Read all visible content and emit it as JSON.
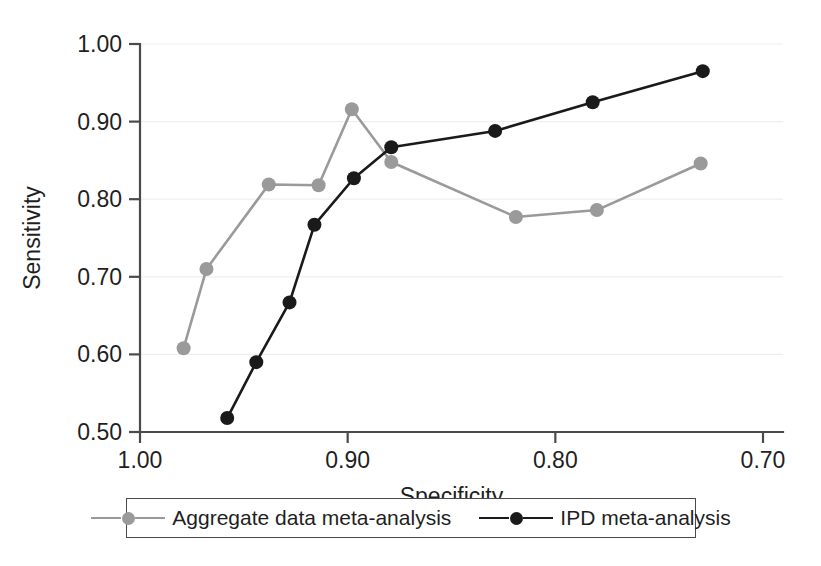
{
  "chart_data": {
    "type": "line",
    "title": "",
    "xlabel": "Specificity",
    "ylabel": "Sensitivity",
    "xlim": [
      1.0,
      0.7
    ],
    "ylim": [
      0.5,
      1.0
    ],
    "x_ticks": [
      "1.00",
      "0.90",
      "0.80",
      "0.70"
    ],
    "x_tick_values": [
      1.0,
      0.9,
      0.8,
      0.7
    ],
    "y_ticks": [
      "0.50",
      "0.60",
      "0.70",
      "0.80",
      "0.90",
      "1.00"
    ],
    "y_tick_values": [
      0.5,
      0.6,
      0.7,
      0.8,
      0.9,
      1.0
    ],
    "x_axis_reversed": true,
    "grid": "horizontal",
    "legend_position": "below",
    "series": [
      {
        "name": "Aggregate data meta-analysis",
        "color": "#9a9a9a",
        "marker": "circle",
        "points": [
          {
            "x": 0.979,
            "y": 0.608
          },
          {
            "x": 0.968,
            "y": 0.71
          },
          {
            "x": 0.938,
            "y": 0.819
          },
          {
            "x": 0.914,
            "y": 0.818
          },
          {
            "x": 0.898,
            "y": 0.916
          },
          {
            "x": 0.879,
            "y": 0.848
          },
          {
            "x": 0.819,
            "y": 0.777
          },
          {
            "x": 0.78,
            "y": 0.786
          },
          {
            "x": 0.73,
            "y": 0.846
          }
        ]
      },
      {
        "name": "IPD meta-analysis",
        "color": "#1a1a1a",
        "marker": "circle",
        "points": [
          {
            "x": 0.958,
            "y": 0.518
          },
          {
            "x": 0.944,
            "y": 0.59
          },
          {
            "x": 0.928,
            "y": 0.667
          },
          {
            "x": 0.916,
            "y": 0.767
          },
          {
            "x": 0.897,
            "y": 0.827
          },
          {
            "x": 0.879,
            "y": 0.867
          },
          {
            "x": 0.829,
            "y": 0.888
          },
          {
            "x": 0.782,
            "y": 0.925
          },
          {
            "x": 0.729,
            "y": 0.965
          }
        ]
      }
    ]
  },
  "legend": {
    "items": [
      {
        "label": "Aggregate data meta-analysis",
        "color": "#9a9a9a"
      },
      {
        "label": "IPD meta-analysis",
        "color": "#1a1a1a"
      }
    ]
  }
}
